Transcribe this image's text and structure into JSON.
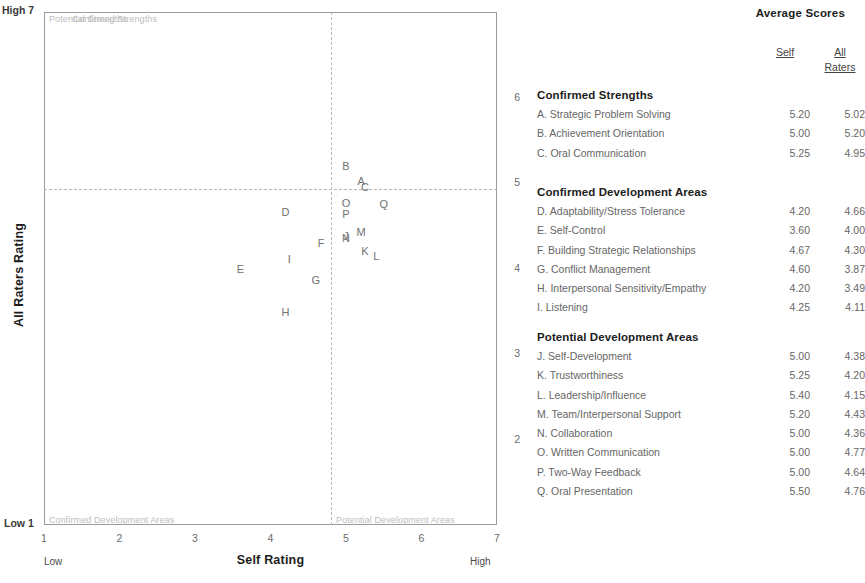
{
  "chart_data": {
    "type": "scatter",
    "title": "",
    "xlabel": "Self Rating",
    "ylabel": "All Raters Rating",
    "xlim": [
      1,
      7
    ],
    "ylim": [
      1,
      7
    ],
    "xticks": [
      "1",
      "2",
      "3",
      "4",
      "5",
      "6",
      "7"
    ],
    "yticks": [
      "1",
      "2",
      "3",
      "4",
      "5",
      "6",
      "7"
    ],
    "grid": false,
    "x_axis_low_label": "Low",
    "x_axis_high_label": "High",
    "y_axis_low_label": "Low",
    "y_axis_high_label": "High",
    "reference_lines": {
      "vertical_x": 4.8,
      "horizontal_y": 4.95
    },
    "quadrants": {
      "top_left": "Potential Strengths",
      "top_right": "Confirmed Strengths",
      "bottom_left": "Confirmed Development Areas",
      "bottom_right": "Potential Development Areas"
    },
    "points": [
      {
        "label": "A",
        "x": 5.2,
        "y": 5.02
      },
      {
        "label": "B",
        "x": 5.0,
        "y": 5.2
      },
      {
        "label": "C",
        "x": 5.25,
        "y": 4.95
      },
      {
        "label": "D",
        "x": 4.2,
        "y": 4.66
      },
      {
        "label": "E",
        "x": 3.6,
        "y": 4.0
      },
      {
        "label": "F",
        "x": 4.67,
        "y": 4.3
      },
      {
        "label": "G",
        "x": 4.6,
        "y": 3.87
      },
      {
        "label": "H",
        "x": 4.2,
        "y": 3.49
      },
      {
        "label": "I",
        "x": 4.25,
        "y": 4.11
      },
      {
        "label": "J",
        "x": 5.0,
        "y": 4.38
      },
      {
        "label": "K",
        "x": 5.25,
        "y": 4.2
      },
      {
        "label": "L",
        "x": 5.4,
        "y": 4.15
      },
      {
        "label": "M",
        "x": 5.2,
        "y": 4.43
      },
      {
        "label": "N",
        "x": 5.0,
        "y": 4.36
      },
      {
        "label": "O",
        "x": 5.0,
        "y": 4.77
      },
      {
        "label": "P",
        "x": 5.0,
        "y": 4.64
      },
      {
        "label": "Q",
        "x": 5.5,
        "y": 4.76
      }
    ]
  },
  "scores": {
    "title": "Average Scores",
    "columns": {
      "self": "Self",
      "all": "All",
      "raters": "Raters"
    },
    "sections": [
      {
        "title": "Confirmed Strengths",
        "rows": [
          {
            "name": "A. Strategic Problem Solving",
            "self": "5.20",
            "all": "5.02"
          },
          {
            "name": "B. Achievement Orientation",
            "self": "5.00",
            "all": "5.20"
          },
          {
            "name": "C. Oral Communication",
            "self": "5.25",
            "all": "4.95"
          }
        ]
      },
      {
        "title": "Confirmed Development Areas",
        "rows": [
          {
            "name": "D. Adaptability/Stress Tolerance",
            "self": "4.20",
            "all": "4.66"
          },
          {
            "name": "E. Self-Control",
            "self": "3.60",
            "all": "4.00"
          },
          {
            "name": "F. Building Strategic Relationships",
            "self": "4.67",
            "all": "4.30"
          },
          {
            "name": "G. Conflict Management",
            "self": "4.60",
            "all": "3.87"
          },
          {
            "name": "H. Interpersonal Sensitivity/Empathy",
            "self": "4.20",
            "all": "3.49"
          },
          {
            "name": "I. Listening",
            "self": "4.25",
            "all": "4.11"
          }
        ]
      },
      {
        "title": "Potential Development Areas",
        "rows": [
          {
            "name": "J. Self-Development",
            "self": "5.00",
            "all": "4.38"
          },
          {
            "name": "K. Trustworthiness",
            "self": "5.25",
            "all": "4.20"
          },
          {
            "name": "L. Leadership/Influence",
            "self": "5.40",
            "all": "4.15"
          },
          {
            "name": "M. Team/Interpersonal Support",
            "self": "5.20",
            "all": "4.43"
          },
          {
            "name": "N. Collaboration",
            "self": "5.00",
            "all": "4.36"
          },
          {
            "name": "O. Written Communication",
            "self": "5.00",
            "all": "4.77"
          },
          {
            "name": "P. Two-Way Feedback",
            "self": "5.00",
            "all": "4.64"
          },
          {
            "name": "Q. Oral Presentation",
            "self": "5.50",
            "all": "4.76"
          }
        ]
      }
    ]
  },
  "axis_corner_labels": {
    "top_left": "High 7",
    "bottom_left": "Low 1"
  }
}
